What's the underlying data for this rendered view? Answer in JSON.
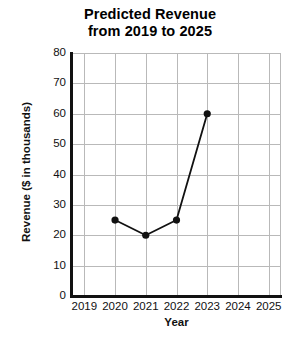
{
  "chart_data": {
    "type": "line",
    "title": "Predicted Revenue from 2019 to 2025",
    "title_lines": [
      "Predicted Revenue",
      "from 2019 to 2025"
    ],
    "xlabel": "Year",
    "ylabel": "Revenue ($ in thousands)",
    "categories": [
      "2019",
      "2020",
      "2021",
      "2022",
      "2023",
      "2024",
      "2025"
    ],
    "x": [
      2019,
      2020,
      2021,
      2022,
      2023,
      2024,
      2025
    ],
    "xlim": [
      2018.6,
      2025.4
    ],
    "ylim": [
      0,
      80
    ],
    "yticks": [
      "80",
      "70",
      "60",
      "50",
      "40",
      "30",
      "20",
      "10",
      "0"
    ],
    "ytick_values": [
      80,
      70,
      60,
      50,
      40,
      30,
      20,
      10,
      0
    ],
    "grid": true,
    "legend": false,
    "series": [
      {
        "name": "Predicted Revenue",
        "color": "#111111",
        "marker": "filled-circle",
        "points": [
          {
            "x": 2020,
            "y": 25
          },
          {
            "x": 2021,
            "y": 20
          },
          {
            "x": 2022,
            "y": 25
          },
          {
            "x": 2023,
            "y": 60
          }
        ],
        "values": [
          null,
          25,
          20,
          25,
          60,
          null,
          null
        ]
      }
    ]
  },
  "colors": {
    "axis": "#111111",
    "grid": "#b9b9b9",
    "series": "#111111",
    "background": "#ffffff",
    "text": "#111111"
  }
}
